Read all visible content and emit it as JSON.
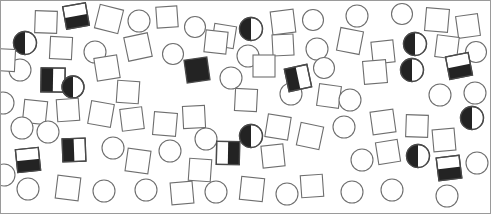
{
  "canvas": {
    "width": 491,
    "height": 214,
    "background": "#ffffff",
    "border_color": "#9a9a9a",
    "border_width": 1
  },
  "style": {
    "outline_stroke": "#6e6e6e",
    "outline_stroke_dark": "#4a4a4a",
    "fill_empty": "#ffffff",
    "fill_solid": "#232323",
    "stroke_width": 1.1,
    "stroke_width_solid": 1.3
  },
  "legend": {
    "shape_kinds": [
      "square",
      "circle"
    ],
    "fill_kinds": [
      "empty",
      "solid",
      "half-left",
      "half-right",
      "half-bottom"
    ]
  },
  "counts": {
    "total": 92,
    "squares": 48,
    "circles": 44,
    "empty": 76,
    "solid": 5,
    "half_left": 7,
    "half_right": 2,
    "half_bottom": 2
  },
  "chart_data": {
    "type": "scatter",
    "title": "",
    "xlabel": "",
    "ylabel": "",
    "xlim": [
      0,
      491
    ],
    "ylim": [
      0,
      214
    ],
    "grid": false,
    "legend": "none",
    "shapes": [
      {
        "id": 1,
        "shape": "square",
        "fill": "empty",
        "x": 46,
        "y": 22,
        "size": 22,
        "rot": 2
      },
      {
        "id": 2,
        "shape": "square",
        "fill": "half-bottom",
        "x": 76,
        "y": 16,
        "size": 23,
        "rot": -10
      },
      {
        "id": 3,
        "shape": "square",
        "fill": "empty",
        "x": 109,
        "y": 19,
        "size": 24,
        "rot": 14
      },
      {
        "id": 4,
        "shape": "circle",
        "fill": "empty",
        "x": 139,
        "y": 21,
        "size": 22,
        "rot": 0
      },
      {
        "id": 5,
        "shape": "square",
        "fill": "empty",
        "x": 167,
        "y": 17,
        "size": 21,
        "rot": -4
      },
      {
        "id": 6,
        "shape": "circle",
        "fill": "empty",
        "x": 195,
        "y": 27,
        "size": 21,
        "rot": 0
      },
      {
        "id": 7,
        "shape": "square",
        "fill": "empty",
        "x": 224,
        "y": 36,
        "size": 22,
        "rot": 9
      },
      {
        "id": 8,
        "shape": "circle",
        "fill": "half-left",
        "x": 251,
        "y": 29,
        "size": 23,
        "rot": 0
      },
      {
        "id": 9,
        "shape": "square",
        "fill": "empty",
        "x": 283,
        "y": 22,
        "size": 23,
        "rot": -7
      },
      {
        "id": 10,
        "shape": "circle",
        "fill": "empty",
        "x": 313,
        "y": 20,
        "size": 21,
        "rot": 0
      },
      {
        "id": 11,
        "shape": "circle",
        "fill": "empty",
        "x": 357,
        "y": 16,
        "size": 22,
        "rot": 0
      },
      {
        "id": 12,
        "shape": "circle",
        "fill": "empty",
        "x": 402,
        "y": 14,
        "size": 21,
        "rot": 0
      },
      {
        "id": 13,
        "shape": "square",
        "fill": "empty",
        "x": 437,
        "y": 20,
        "size": 23,
        "rot": 5
      },
      {
        "id": 14,
        "shape": "square",
        "fill": "empty",
        "x": 468,
        "y": 26,
        "size": 22,
        "rot": -8
      },
      {
        "id": 15,
        "shape": "circle",
        "fill": "half-left",
        "x": 25,
        "y": 43,
        "size": 23,
        "rot": 0
      },
      {
        "id": 16,
        "shape": "square",
        "fill": "empty",
        "x": 61,
        "y": 48,
        "size": 22,
        "rot": 3
      },
      {
        "id": 17,
        "shape": "circle",
        "fill": "empty",
        "x": 95,
        "y": 52,
        "size": 22,
        "rot": 0
      },
      {
        "id": 18,
        "shape": "square",
        "fill": "empty",
        "x": 138,
        "y": 47,
        "size": 24,
        "rot": -12
      },
      {
        "id": 19,
        "shape": "circle",
        "fill": "empty",
        "x": 173,
        "y": 54,
        "size": 21,
        "rot": 0
      },
      {
        "id": 20,
        "shape": "square",
        "fill": "empty",
        "x": 216,
        "y": 42,
        "size": 22,
        "rot": 6
      },
      {
        "id": 21,
        "shape": "circle",
        "fill": "empty",
        "x": 248,
        "y": 56,
        "size": 22,
        "rot": 0
      },
      {
        "id": 22,
        "shape": "square",
        "fill": "empty",
        "x": 283,
        "y": 45,
        "size": 21,
        "rot": -3
      },
      {
        "id": 23,
        "shape": "circle",
        "fill": "empty",
        "x": 317,
        "y": 49,
        "size": 22,
        "rot": 0
      },
      {
        "id": 24,
        "shape": "square",
        "fill": "empty",
        "x": 350,
        "y": 41,
        "size": 23,
        "rot": 11
      },
      {
        "id": 25,
        "shape": "square",
        "fill": "empty",
        "x": 383,
        "y": 52,
        "size": 22,
        "rot": -6
      },
      {
        "id": 26,
        "shape": "circle",
        "fill": "half-left",
        "x": 415,
        "y": 44,
        "size": 23,
        "rot": 0
      },
      {
        "id": 27,
        "shape": "square",
        "fill": "empty",
        "x": 447,
        "y": 47,
        "size": 22,
        "rot": 7
      },
      {
        "id": 28,
        "shape": "circle",
        "fill": "empty",
        "x": 476,
        "y": 52,
        "size": 21,
        "rot": 0
      },
      {
        "id": 29,
        "shape": "circle",
        "fill": "empty",
        "x": 20,
        "y": 70,
        "size": 22,
        "rot": 0
      },
      {
        "id": 30,
        "shape": "square",
        "fill": "half-left",
        "x": 53,
        "y": 80,
        "size": 24,
        "rot": 1
      },
      {
        "id": 31,
        "shape": "circle",
        "fill": "half-left",
        "x": 73,
        "y": 87,
        "size": 22,
        "rot": 0
      },
      {
        "id": 32,
        "shape": "square",
        "fill": "empty",
        "x": 107,
        "y": 68,
        "size": 23,
        "rot": -9
      },
      {
        "id": 33,
        "shape": "square",
        "fill": "empty",
        "x": 128,
        "y": 92,
        "size": 22,
        "rot": 4
      },
      {
        "id": 34,
        "shape": "square",
        "fill": "solid",
        "x": 197,
        "y": 70,
        "size": 23,
        "rot": -8
      },
      {
        "id": 35,
        "shape": "circle",
        "fill": "empty",
        "x": 231,
        "y": 78,
        "size": 22,
        "rot": 0
      },
      {
        "id": 36,
        "shape": "square",
        "fill": "empty",
        "x": 246,
        "y": 100,
        "size": 22,
        "rot": 3
      },
      {
        "id": 37,
        "shape": "square",
        "fill": "empty",
        "x": 264,
        "y": 66,
        "size": 22,
        "rot": 0
      },
      {
        "id": 38,
        "shape": "circle",
        "fill": "empty",
        "x": 291,
        "y": 94,
        "size": 22,
        "rot": 0
      },
      {
        "id": 39,
        "shape": "square",
        "fill": "half-left",
        "x": 298,
        "y": 78,
        "size": 23,
        "rot": -12
      },
      {
        "id": 40,
        "shape": "circle",
        "fill": "empty",
        "x": 324,
        "y": 68,
        "size": 21,
        "rot": 0
      },
      {
        "id": 41,
        "shape": "square",
        "fill": "empty",
        "x": 329,
        "y": 96,
        "size": 22,
        "rot": 8
      },
      {
        "id": 42,
        "shape": "square",
        "fill": "empty",
        "x": 375,
        "y": 72,
        "size": 23,
        "rot": -5
      },
      {
        "id": 43,
        "shape": "circle",
        "fill": "empty",
        "x": 350,
        "y": 100,
        "size": 22,
        "rot": 0
      },
      {
        "id": 44,
        "shape": "circle",
        "fill": "half-left",
        "x": 412,
        "y": 70,
        "size": 23,
        "rot": 0
      },
      {
        "id": 45,
        "shape": "square",
        "fill": "half-bottom",
        "x": 459,
        "y": 66,
        "size": 23,
        "rot": -11
      },
      {
        "id": 46,
        "shape": "circle",
        "fill": "empty",
        "x": 440,
        "y": 95,
        "size": 22,
        "rot": 0
      },
      {
        "id": 47,
        "shape": "circle",
        "fill": "empty",
        "x": 475,
        "y": 93,
        "size": 22,
        "rot": 0
      },
      {
        "id": 48,
        "shape": "square",
        "fill": "empty",
        "x": 35,
        "y": 112,
        "size": 23,
        "rot": 6
      },
      {
        "id": 49,
        "shape": "square",
        "fill": "empty",
        "x": 68,
        "y": 110,
        "size": 22,
        "rot": -4
      },
      {
        "id": 50,
        "shape": "square",
        "fill": "empty",
        "x": 101,
        "y": 114,
        "size": 23,
        "rot": 10
      },
      {
        "id": 51,
        "shape": "square",
        "fill": "empty",
        "x": 132,
        "y": 119,
        "size": 22,
        "rot": -7
      },
      {
        "id": 52,
        "shape": "square",
        "fill": "empty",
        "x": 165,
        "y": 124,
        "size": 23,
        "rot": 5
      },
      {
        "id": 53,
        "shape": "square",
        "fill": "empty",
        "x": 194,
        "y": 117,
        "size": 22,
        "rot": -3
      },
      {
        "id": 54,
        "shape": "circle",
        "fill": "empty",
        "x": 206,
        "y": 139,
        "size": 22,
        "rot": 0
      },
      {
        "id": 55,
        "shape": "circle",
        "fill": "half-left",
        "x": 251,
        "y": 136,
        "size": 23,
        "rot": 0
      },
      {
        "id": 56,
        "shape": "square",
        "fill": "empty",
        "x": 278,
        "y": 127,
        "size": 23,
        "rot": 9
      },
      {
        "id": 57,
        "shape": "square",
        "fill": "empty",
        "x": 273,
        "y": 156,
        "size": 22,
        "rot": -6
      },
      {
        "id": 58,
        "shape": "square",
        "fill": "empty",
        "x": 310,
        "y": 136,
        "size": 23,
        "rot": 12
      },
      {
        "id": 59,
        "shape": "circle",
        "fill": "empty",
        "x": 344,
        "y": 127,
        "size": 22,
        "rot": 0
      },
      {
        "id": 60,
        "shape": "square",
        "fill": "empty",
        "x": 383,
        "y": 122,
        "size": 23,
        "rot": -8
      },
      {
        "id": 61,
        "shape": "square",
        "fill": "empty",
        "x": 417,
        "y": 126,
        "size": 22,
        "rot": 2
      },
      {
        "id": 62,
        "shape": "square",
        "fill": "empty",
        "x": 444,
        "y": 140,
        "size": 22,
        "rot": -5
      },
      {
        "id": 63,
        "shape": "circle",
        "fill": "half-left",
        "x": 472,
        "y": 118,
        "size": 23,
        "rot": 0
      },
      {
        "id": 64,
        "shape": "circle",
        "fill": "empty",
        "x": 22,
        "y": 128,
        "size": 22,
        "rot": 0
      },
      {
        "id": 65,
        "shape": "circle",
        "fill": "empty",
        "x": 48,
        "y": 132,
        "size": 22,
        "rot": 0
      },
      {
        "id": 66,
        "shape": "square",
        "fill": "half-left",
        "x": 74,
        "y": 150,
        "size": 23,
        "rot": -2
      },
      {
        "id": 67,
        "shape": "circle",
        "fill": "empty",
        "x": 113,
        "y": 148,
        "size": 22,
        "rot": 0
      },
      {
        "id": 68,
        "shape": "square",
        "fill": "empty",
        "x": 138,
        "y": 161,
        "size": 23,
        "rot": 8
      },
      {
        "id": 69,
        "shape": "square",
        "fill": "half-right",
        "x": 228,
        "y": 153,
        "size": 23,
        "rot": 1
      },
      {
        "id": 70,
        "shape": "square",
        "fill": "half-bottom",
        "x": 28,
        "y": 160,
        "size": 23,
        "rot": -6
      },
      {
        "id": 71,
        "shape": "circle",
        "fill": "empty",
        "x": 170,
        "y": 151,
        "size": 22,
        "rot": 0
      },
      {
        "id": 72,
        "shape": "square",
        "fill": "empty",
        "x": 200,
        "y": 170,
        "size": 22,
        "rot": 4
      },
      {
        "id": 73,
        "shape": "circle",
        "fill": "empty",
        "x": 362,
        "y": 160,
        "size": 22,
        "rot": 0
      },
      {
        "id": 74,
        "shape": "square",
        "fill": "empty",
        "x": 388,
        "y": 152,
        "size": 22,
        "rot": -9
      },
      {
        "id": 75,
        "shape": "circle",
        "fill": "half-left",
        "x": 418,
        "y": 156,
        "size": 23,
        "rot": 0
      },
      {
        "id": 76,
        "shape": "square",
        "fill": "half-bottom",
        "x": 449,
        "y": 168,
        "size": 23,
        "rot": -7
      },
      {
        "id": 77,
        "shape": "circle",
        "fill": "empty",
        "x": 477,
        "y": 163,
        "size": 22,
        "rot": 0
      },
      {
        "id": 78,
        "shape": "circle",
        "fill": "empty",
        "x": 28,
        "y": 189,
        "size": 22,
        "rot": 0
      },
      {
        "id": 79,
        "shape": "square",
        "fill": "empty",
        "x": 68,
        "y": 188,
        "size": 23,
        "rot": 7
      },
      {
        "id": 80,
        "shape": "circle",
        "fill": "empty",
        "x": 104,
        "y": 191,
        "size": 22,
        "rot": 0
      },
      {
        "id": 81,
        "shape": "circle",
        "fill": "empty",
        "x": 146,
        "y": 190,
        "size": 22,
        "rot": 0
      },
      {
        "id": 82,
        "shape": "square",
        "fill": "empty",
        "x": 182,
        "y": 193,
        "size": 22,
        "rot": -5
      },
      {
        "id": 83,
        "shape": "circle",
        "fill": "empty",
        "x": 216,
        "y": 192,
        "size": 22,
        "rot": 0
      },
      {
        "id": 84,
        "shape": "square",
        "fill": "empty",
        "x": 252,
        "y": 189,
        "size": 23,
        "rot": 6
      },
      {
        "id": 85,
        "shape": "circle",
        "fill": "empty",
        "x": 287,
        "y": 194,
        "size": 22,
        "rot": 0
      },
      {
        "id": 86,
        "shape": "square",
        "fill": "empty",
        "x": 312,
        "y": 186,
        "size": 22,
        "rot": -4
      },
      {
        "id": 87,
        "shape": "circle",
        "fill": "empty",
        "x": 352,
        "y": 192,
        "size": 22,
        "rot": 0
      },
      {
        "id": 88,
        "shape": "circle",
        "fill": "empty",
        "x": 392,
        "y": 190,
        "size": 22,
        "rot": 0
      },
      {
        "id": 89,
        "shape": "circle",
        "fill": "empty",
        "x": 447,
        "y": 196,
        "size": 22,
        "rot": 0
      },
      {
        "id": 90,
        "shape": "square",
        "fill": "empty",
        "x": 4,
        "y": 60,
        "size": 22,
        "rot": 3
      },
      {
        "id": 91,
        "shape": "circle",
        "fill": "empty",
        "x": 3,
        "y": 103,
        "size": 22,
        "rot": 0
      },
      {
        "id": 92,
        "shape": "circle",
        "fill": "empty",
        "x": 4,
        "y": 175,
        "size": 22,
        "rot": 0
      }
    ]
  }
}
